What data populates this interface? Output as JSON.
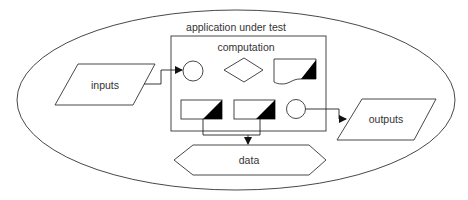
{
  "diagram": {
    "container_label": "application under test",
    "computation_label": "computation",
    "inputs_label": "inputs",
    "outputs_label": "outputs",
    "data_label": "data",
    "shapes": {
      "computation_row1": [
        "circle",
        "diamond",
        "document-with-corner"
      ],
      "computation_row2": [
        "rect-with-corner",
        "rect-with-corner",
        "circle"
      ]
    },
    "edges": [
      {
        "from": "inputs",
        "to": "computation-circle-1"
      },
      {
        "from": "computation-circle-2",
        "to": "outputs"
      },
      {
        "from": "computation-rect-1",
        "to": "data"
      },
      {
        "from": "computation-rect-2",
        "to": "data"
      }
    ],
    "colors": {
      "stroke": "#333333",
      "fill": "#ffffff",
      "corner_fill": "#000000",
      "text": "#333333"
    }
  }
}
